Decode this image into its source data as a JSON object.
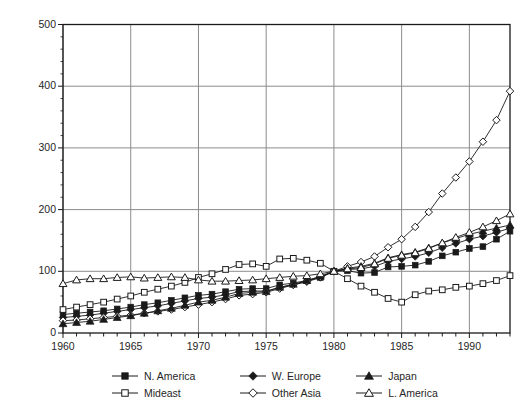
{
  "chart_data": {
    "type": "line",
    "title": "",
    "xlabel": "",
    "ylabel": "Quantum index (1980 =100)",
    "xlim": [
      1960,
      1993
    ],
    "ylim": [
      0,
      500
    ],
    "yticks": [
      0,
      100,
      200,
      300,
      400,
      500
    ],
    "xticks": [
      1960,
      1965,
      1970,
      1975,
      1980,
      1985,
      1990
    ],
    "grid": true,
    "legend_position": "bottom",
    "x": [
      1960,
      1961,
      1962,
      1963,
      1964,
      1965,
      1966,
      1967,
      1968,
      1969,
      1970,
      1971,
      1972,
      1973,
      1974,
      1975,
      1976,
      1977,
      1978,
      1979,
      1980,
      1981,
      1982,
      1983,
      1984,
      1985,
      1986,
      1987,
      1988,
      1989,
      1990,
      1991,
      1992,
      1993
    ],
    "series": [
      {
        "name": "N. America",
        "marker": "filled-square",
        "values": [
          30,
          32,
          34,
          36,
          39,
          42,
          46,
          49,
          53,
          57,
          61,
          63,
          67,
          71,
          72,
          72,
          78,
          81,
          85,
          90,
          100,
          101,
          97,
          98,
          107,
          108,
          110,
          116,
          125,
          131,
          137,
          140,
          152,
          165
        ]
      },
      {
        "name": "Mideast",
        "marker": "open-square",
        "values": [
          38,
          42,
          46,
          50,
          55,
          60,
          66,
          71,
          76,
          82,
          90,
          96,
          103,
          111,
          112,
          108,
          120,
          121,
          118,
          113,
          100,
          88,
          76,
          66,
          56,
          50,
          62,
          68,
          70,
          74,
          76,
          80,
          85,
          93
        ]
      },
      {
        "name": "W. Europe",
        "marker": "filled-diamond",
        "values": [
          25,
          27,
          29,
          32,
          35,
          38,
          41,
          44,
          48,
          52,
          56,
          58,
          62,
          67,
          68,
          68,
          74,
          78,
          83,
          90,
          100,
          103,
          104,
          108,
          116,
          120,
          124,
          130,
          138,
          145,
          152,
          157,
          163,
          170
        ]
      },
      {
        "name": "Other Asia",
        "marker": "open-diamond",
        "values": [
          20,
          21,
          23,
          25,
          27,
          29,
          32,
          35,
          38,
          42,
          46,
          50,
          55,
          61,
          63,
          66,
          72,
          78,
          84,
          91,
          100,
          108,
          115,
          124,
          139,
          152,
          172,
          196,
          226,
          252,
          278,
          310,
          345,
          392
        ]
      },
      {
        "name": "Japan",
        "marker": "filled-triangle",
        "values": [
          15,
          17,
          19,
          22,
          25,
          28,
          32,
          36,
          40,
          45,
          50,
          53,
          58,
          64,
          66,
          67,
          74,
          79,
          85,
          92,
          100,
          105,
          108,
          113,
          122,
          127,
          131,
          138,
          146,
          153,
          160,
          165,
          170,
          175
        ]
      },
      {
        "name": "L. America",
        "marker": "open-triangle",
        "values": [
          80,
          86,
          88,
          88,
          90,
          91,
          89,
          90,
          91,
          90,
          86,
          84,
          84,
          85,
          86,
          88,
          90,
          92,
          93,
          96,
          100,
          104,
          106,
          112,
          121,
          126,
          130,
          137,
          146,
          155,
          163,
          172,
          182,
          193
        ]
      }
    ]
  },
  "axes": {
    "ytick_labels": [
      "500",
      "400",
      "300",
      "200",
      "100",
      "0"
    ],
    "xtick_labels": [
      "1960",
      "1965",
      "1970",
      "1975",
      "1980",
      "1985",
      "1990"
    ],
    "ylabel": "Quantum index (1980 =100)"
  },
  "legend": {
    "rows": [
      [
        {
          "label": "N. America",
          "marker": "filled-square"
        },
        {
          "label": "W. Europe",
          "marker": "filled-diamond"
        },
        {
          "label": "Japan",
          "marker": "filled-triangle"
        }
      ],
      [
        {
          "label": "Mideast",
          "marker": "open-square"
        },
        {
          "label": "Other Asia",
          "marker": "open-diamond"
        },
        {
          "label": "L. America",
          "marker": "open-triangle"
        }
      ]
    ]
  },
  "colors": {
    "line": "#1a1a1a",
    "grid": "#8c8c8c",
    "frame": "#1a1a1a",
    "background": "#ffffff",
    "text": "#262626"
  }
}
